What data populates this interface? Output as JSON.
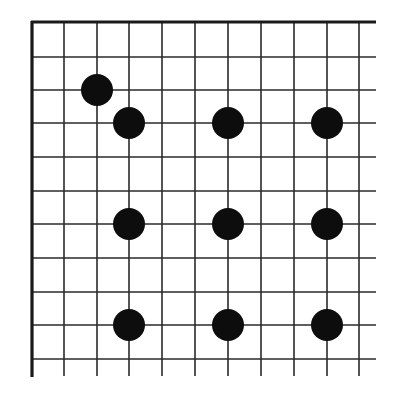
{
  "diagram": {
    "type": "go-board-corner",
    "colors": {
      "background": "#ffffff",
      "grid_line": "#2a2a2a",
      "edge_line": "#1a1a1a",
      "stone": "#0d0d0d"
    },
    "grid": {
      "x_lines": [
        32,
        64,
        97,
        129,
        162,
        195,
        228,
        261,
        294,
        327,
        359
      ],
      "y_lines": [
        22,
        57,
        90,
        123,
        157,
        191,
        224,
        258,
        292,
        325,
        359
      ],
      "line_extent_right": 376,
      "line_extent_bottom": 376,
      "thin_width": 1.6,
      "edge_width": 3.2,
      "edges": [
        "top",
        "left"
      ]
    },
    "stones": [
      {
        "color": "black",
        "col": 2,
        "row": 2,
        "x": 97,
        "y": 90
      },
      {
        "color": "black",
        "col": 3,
        "row": 3,
        "x": 129,
        "y": 123
      },
      {
        "color": "black",
        "col": 6,
        "row": 3,
        "x": 228,
        "y": 123
      },
      {
        "color": "black",
        "col": 9,
        "row": 3,
        "x": 327,
        "y": 123
      },
      {
        "color": "black",
        "col": 3,
        "row": 6,
        "x": 129,
        "y": 224
      },
      {
        "color": "black",
        "col": 6,
        "row": 6,
        "x": 228,
        "y": 224
      },
      {
        "color": "black",
        "col": 9,
        "row": 6,
        "x": 327,
        "y": 224
      },
      {
        "color": "black",
        "col": 3,
        "row": 9,
        "x": 129,
        "y": 325
      },
      {
        "color": "black",
        "col": 6,
        "row": 9,
        "x": 228,
        "y": 325
      },
      {
        "color": "black",
        "col": 9,
        "row": 9,
        "x": 327,
        "y": 325
      }
    ],
    "stone_radius": 16
  }
}
